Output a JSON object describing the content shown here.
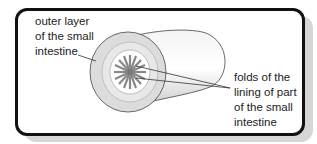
{
  "diagram": {
    "labels": {
      "outer": [
        "outer layer",
        "of the small",
        "intestine"
      ],
      "folds": [
        "folds of the",
        "lining of part",
        "of the small",
        "intestine"
      ]
    }
  }
}
